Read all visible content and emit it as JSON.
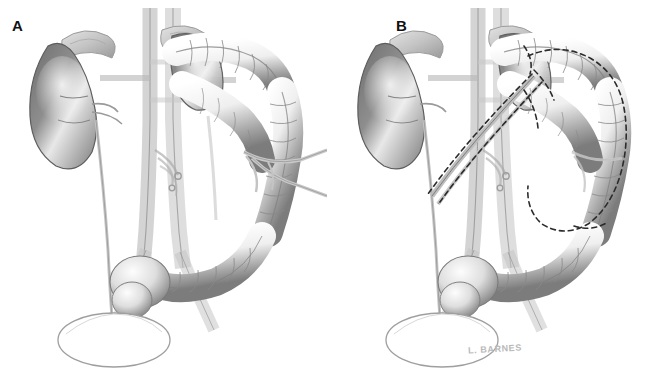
{
  "figure": {
    "background_color": "#ffffff",
    "width": 655,
    "height": 377,
    "style": "graphite pencil medical illustration, grayscale"
  },
  "panels": [
    {
      "id": "A",
      "label": "A",
      "caption": "Normal anatomy: kidneys, adrenal glands, great vessels, ureters, colon and bladder",
      "has_dashed_markings": false,
      "has_signature": false
    },
    {
      "id": "B",
      "label": "B",
      "caption": "Same anatomy with dashed resection outline around the splenic flexure / descending colon and mobilized vascular pedicle",
      "has_dashed_markings": true,
      "has_signature": true
    }
  ],
  "signature": {
    "text": "L. BARNES",
    "color": "#b9b9b9"
  },
  "structures": {
    "left_kidney": "kidney",
    "right_kidney": "kidney",
    "adrenal_gland": "adrenal-gland",
    "aorta": "aorta",
    "inferior_vena_cava": "inferior-vena-cava",
    "renal_vessels": "renal-vessels",
    "ureter": "ureter",
    "transverse_colon": "transverse-colon",
    "descending_colon": "descending-colon",
    "sigmoid_colon": "sigmoid-colon",
    "cecum": "cecum",
    "ascending_colon": "ascending-colon",
    "mesenteric_vessels": "mesenteric-vessels",
    "bladder": "bladder",
    "resection_line": "dashed-resection-line",
    "vascular_pedicle": "vascular-pedicle"
  },
  "colors": {
    "background": "#ffffff",
    "ink_dark": "#3a3a3a",
    "ink_mid": "#8d8d8d",
    "ink_light": "#cfcfcf",
    "organ_shade_dark": "#6e6e6e",
    "organ_shade_mid": "#a8a8a8",
    "organ_highlight": "#f2f2f2",
    "label_color": "#111111",
    "dashed_color": "#2b2b2b"
  }
}
